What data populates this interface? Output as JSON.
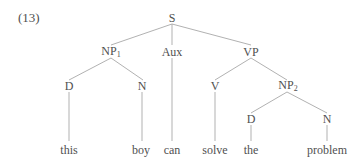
{
  "example_number": "(13)",
  "nodes": {
    "S": {
      "label": "S"
    },
    "NP1": {
      "label": "NP",
      "sub": "1"
    },
    "Aux": {
      "label": "Aux"
    },
    "VP": {
      "label": "VP"
    },
    "D1": {
      "label": "D"
    },
    "N1": {
      "label": "N"
    },
    "V": {
      "label": "V"
    },
    "NP2": {
      "label": "NP",
      "sub": "2"
    },
    "D2": {
      "label": "D"
    },
    "N2": {
      "label": "N"
    }
  },
  "leaves": {
    "this": "this",
    "boy": "boy",
    "can": "can",
    "solve": "solve",
    "the": "the",
    "problem": "problem"
  },
  "edges": [
    [
      "S",
      "NP1"
    ],
    [
      "S",
      "Aux"
    ],
    [
      "S",
      "VP"
    ],
    [
      "NP1",
      "D1"
    ],
    [
      "NP1",
      "N1"
    ],
    [
      "VP",
      "V"
    ],
    [
      "VP",
      "NP2"
    ],
    [
      "NP2",
      "D2"
    ],
    [
      "NP2",
      "N2"
    ],
    [
      "D1",
      "this"
    ],
    [
      "N1",
      "boy"
    ],
    [
      "Aux",
      "can"
    ],
    [
      "V",
      "solve"
    ],
    [
      "D2",
      "the"
    ],
    [
      "N2",
      "problem"
    ]
  ],
  "colors": {
    "line": "#a0a0a0",
    "text": "#505050"
  }
}
